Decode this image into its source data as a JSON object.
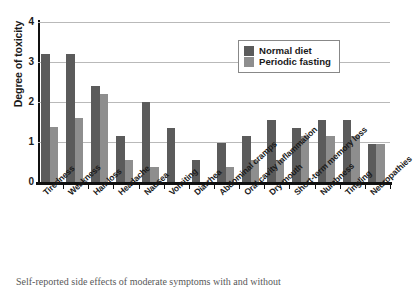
{
  "chart_data": {
    "type": "bar",
    "title": "",
    "xlabel": "",
    "ylabel": "Degree of toxicity",
    "ylim": [
      0,
      4
    ],
    "yticks": [
      0,
      1,
      2,
      3,
      4
    ],
    "grid": true,
    "legend_position": "top-right",
    "categories": [
      "Tiredness",
      "Weakness",
      "Hair loss",
      "Headache",
      "Nausea",
      "Vomiting",
      "Diarrhea",
      "Abdominal cramps",
      "Oral cavity inflammation",
      "Dry mouth",
      "Short-term memory loss",
      "Numbness",
      "Tingling",
      "Neuropathies"
    ],
    "series": [
      {
        "name": "Normal diet",
        "color": "#5b5b5b",
        "values": [
          3.2,
          3.2,
          2.4,
          1.15,
          2.0,
          1.35,
          0.55,
          0.98,
          1.15,
          1.55,
          1.35,
          1.55,
          1.55,
          0.95
        ]
      },
      {
        "name": "Periodic fasting",
        "color": "#8e8e8e",
        "values": [
          1.38,
          1.6,
          2.2,
          0.55,
          0.38,
          0,
          0,
          0.38,
          0.55,
          0.55,
          1.15,
          1.15,
          1.15,
          0.95
        ]
      }
    ]
  },
  "legend": {
    "items": [
      {
        "label": "Normal diet",
        "swatch": "normal"
      },
      {
        "label": "Periodic fasting",
        "swatch": "fasting"
      }
    ]
  },
  "caption": {
    "fragment": "Self-reported side effects of moderate symptoms with and without"
  }
}
